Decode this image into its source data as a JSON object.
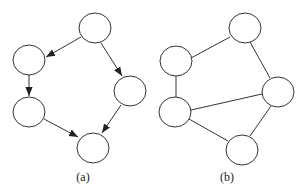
{
  "diagrams": [
    {
      "label": "(a)",
      "type": "directed-graph",
      "nodes": [
        {
          "id": "a1",
          "position": "top"
        },
        {
          "id": "a2",
          "position": "left-upper"
        },
        {
          "id": "a3",
          "position": "left-lower"
        },
        {
          "id": "a4",
          "position": "right"
        },
        {
          "id": "a5",
          "position": "bottom"
        }
      ],
      "edges": [
        {
          "from": "a1",
          "to": "a2",
          "directed": true
        },
        {
          "from": "a1",
          "to": "a4",
          "directed": true
        },
        {
          "from": "a2",
          "to": "a3",
          "directed": true
        },
        {
          "from": "a3",
          "to": "a5",
          "directed": true
        },
        {
          "from": "a4",
          "to": "a5",
          "directed": true
        }
      ]
    },
    {
      "label": "(b)",
      "type": "undirected-graph",
      "nodes": [
        {
          "id": "b1",
          "position": "top"
        },
        {
          "id": "b2",
          "position": "left-upper"
        },
        {
          "id": "b3",
          "position": "left-lower"
        },
        {
          "id": "b4",
          "position": "right"
        },
        {
          "id": "b5",
          "position": "bottom"
        }
      ],
      "edges": [
        {
          "from": "b1",
          "to": "b2",
          "directed": false
        },
        {
          "from": "b1",
          "to": "b4",
          "directed": false
        },
        {
          "from": "b2",
          "to": "b3",
          "directed": false
        },
        {
          "from": "b3",
          "to": "b4",
          "directed": false
        },
        {
          "from": "b3",
          "to": "b5",
          "directed": false
        },
        {
          "from": "b4",
          "to": "b5",
          "directed": false
        }
      ]
    }
  ],
  "colors": {
    "stroke": "#333333",
    "fill": "#ffffff",
    "background": "#ffffff"
  }
}
